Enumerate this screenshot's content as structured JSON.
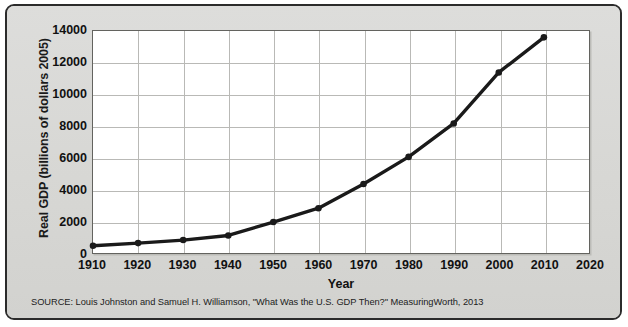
{
  "figure": {
    "source_note": "SOURCE: Louis Johnston and Samuel H. Williamson, \"What Was the U.S. GDP Then?\" MeasuringWorth, 2013",
    "frame_color": "#2b2b2b",
    "background_color": "#d9d9d6",
    "plot_background_color": "#ffffff",
    "gridline_color": "#b9b9b6",
    "series_color": "#1a1a1a"
  },
  "chart_data": {
    "type": "line",
    "title": "",
    "xlabel": "Year",
    "ylabel": "Real GDP (billions of dollars 2005)",
    "xlim": [
      1910,
      2020
    ],
    "ylim": [
      0,
      14000
    ],
    "xticks": [
      1910,
      1920,
      1930,
      1940,
      1950,
      1960,
      1970,
      1980,
      1990,
      2000,
      2010,
      2020
    ],
    "yticks": [
      0,
      2000,
      4000,
      6000,
      8000,
      10000,
      12000,
      14000
    ],
    "grid": true,
    "legend": "none",
    "markers": "filled-circle",
    "x": [
      1910,
      1920,
      1930,
      1940,
      1950,
      1960,
      1970,
      1980,
      1990,
      2000,
      2010
    ],
    "values": [
      520,
      690,
      880,
      1170,
      2010,
      2880,
      4400,
      6100,
      8200,
      11400,
      13600
    ],
    "series": [
      {
        "name": "Real GDP",
        "x": [
          1910,
          1920,
          1930,
          1940,
          1950,
          1960,
          1970,
          1980,
          1990,
          2000,
          2010
        ],
        "values": [
          520,
          690,
          880,
          1170,
          2010,
          2880,
          4400,
          6100,
          8200,
          11400,
          13600
        ]
      }
    ]
  }
}
